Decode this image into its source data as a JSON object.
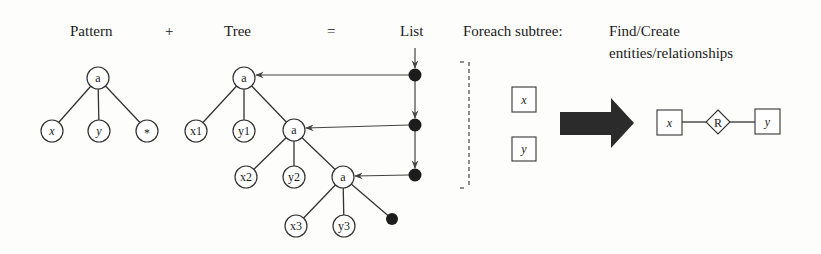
{
  "headers": {
    "pattern": "Pattern",
    "plus": "+",
    "tree": "Tree",
    "equals": "=",
    "list": "List",
    "foreach": "Foreach subtree:",
    "find_line1": "Find/Create",
    "find_line2": "entities/relationships"
  },
  "pattern_tree": {
    "root": "a",
    "children": [
      "x",
      "y",
      "*"
    ]
  },
  "tree": {
    "level1": {
      "root": "a",
      "children": [
        "x1",
        "y1"
      ]
    },
    "level2": {
      "root": "a",
      "children": [
        "x2",
        "y2"
      ]
    },
    "level3": {
      "root": "a",
      "children": [
        "x3",
        "y3"
      ]
    },
    "terminal": "nil-dot"
  },
  "list": {
    "node_count": 3
  },
  "subtree_boxes": [
    "x",
    "y"
  ],
  "er_diagram": {
    "entity_left": "x",
    "relationship": "R",
    "entity_right": "y"
  },
  "colors": {
    "ink": "#1a1a1a",
    "arrow_fill": "#2b2b2b",
    "background": "#fdfdfc"
  }
}
